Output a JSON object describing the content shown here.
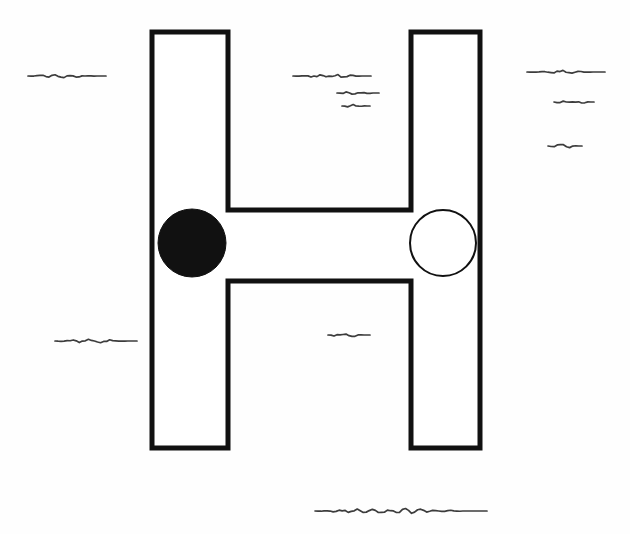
{
  "figure": {
    "background_color": "#fefefe",
    "ink_color": "#111111",
    "width": 630,
    "height": 534,
    "alt_text": "A large outline capital letter H drawn in thick black stroke on white paper. A solid black filled circle sits on the left vertical stroke at mid height, and an unfilled white circle with a thin black outline sits on the right vertical stroke at the same height. Short wavy pen squiggles representing illegible handwriting are scattered around the letter."
  },
  "letter": {
    "name": "H",
    "fill_color": "#ffffff",
    "stroke_color": "#111111",
    "stroke_width": 5,
    "left_stem": {
      "x": 152,
      "y": 32,
      "width": 76,
      "height": 416
    },
    "right_stem": {
      "x": 411,
      "y": 32,
      "width": 69,
      "height": 416
    },
    "crossbar": {
      "x": 228,
      "y": 210,
      "width": 183,
      "height": 71
    }
  },
  "markers": [
    {
      "name": "filled-circle",
      "label": "solid black circle",
      "cx": 192,
      "cy": 243,
      "r": 34,
      "fill": "#111111",
      "stroke": "#111111",
      "stroke_width": 1,
      "position": "left stem"
    },
    {
      "name": "open-circle",
      "label": "unfilled white circle",
      "cx": 443,
      "cy": 243,
      "r": 33,
      "fill": "#ffffff",
      "stroke": "#111111",
      "stroke_width": 2,
      "position": "right stem"
    }
  ],
  "squiggles": [
    {
      "name": "squiggle-left-upper",
      "x": 28,
      "y": 76,
      "length": 78,
      "amplitude": 2.0,
      "waves": 5
    },
    {
      "name": "squiggle-mid-upper-1",
      "x": 293,
      "y": 76,
      "length": 78,
      "amplitude": 2.2,
      "waves": 5
    },
    {
      "name": "squiggle-mid-upper-2",
      "x": 337,
      "y": 93,
      "length": 42,
      "amplitude": 2.2,
      "waves": 3
    },
    {
      "name": "squiggle-mid-upper-3",
      "x": 342,
      "y": 106,
      "length": 28,
      "amplitude": 1.8,
      "waves": 2
    },
    {
      "name": "squiggle-right-1",
      "x": 527,
      "y": 72,
      "length": 78,
      "amplitude": 2.0,
      "waves": 4
    },
    {
      "name": "squiggle-right-2",
      "x": 554,
      "y": 102,
      "length": 40,
      "amplitude": 2.6,
      "waves": 3
    },
    {
      "name": "squiggle-right-3",
      "x": 548,
      "y": 146,
      "length": 34,
      "amplitude": 2.2,
      "waves": 2
    },
    {
      "name": "squiggle-left-lower",
      "x": 55,
      "y": 341,
      "length": 82,
      "amplitude": 2.2,
      "waves": 4
    },
    {
      "name": "squiggle-mid-lower",
      "x": 328,
      "y": 335,
      "length": 42,
      "amplitude": 2.2,
      "waves": 2
    },
    {
      "name": "squiggle-bottom",
      "x": 315,
      "y": 511,
      "length": 172,
      "amplitude": 3.0,
      "waves": 11
    }
  ]
}
